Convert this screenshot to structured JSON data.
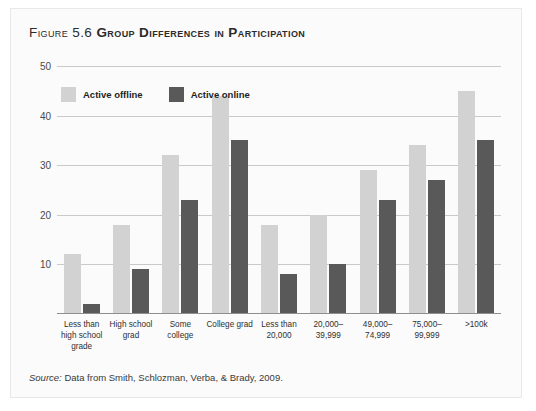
{
  "figure": {
    "number": "Figure 5.6",
    "title": "Group Differences in Participation",
    "source_word": "Source:",
    "source_text": " Data from Smith, Schlozman, Verba, & Brady, 2009."
  },
  "colors": {
    "offline": "#d2d2d2",
    "online": "#59595a",
    "gridline": "#c9c9c9",
    "axis": "#8e8e8e",
    "panel_background": "#fbfbfb"
  },
  "chart_data": {
    "type": "bar",
    "title": "Group Differences in Participation",
    "xlabel": "",
    "ylabel": "",
    "ylim": [
      0,
      50
    ],
    "yticks": [
      0,
      10,
      20,
      30,
      40,
      50
    ],
    "ytick_labels": [
      "0",
      "10",
      "20",
      "30",
      "40",
      "50"
    ],
    "grid": true,
    "legend_position": "top-left",
    "categories": [
      "Less than\nhigh school\ngrade",
      "High school\ngrad",
      "Some college",
      "College grad",
      "Less than\n20,000",
      "20,000–39,999",
      "49,000–74,999",
      "75,000–99,999",
      ">100k"
    ],
    "series": [
      {
        "name": "Active offline",
        "color": "#d2d2d2",
        "values": [
          12,
          18,
          32,
          44,
          18,
          20,
          29,
          34,
          45
        ]
      },
      {
        "name": "Active online",
        "color": "#59595a",
        "values": [
          2,
          9,
          23,
          35,
          8,
          10,
          23,
          27,
          35
        ]
      }
    ]
  }
}
